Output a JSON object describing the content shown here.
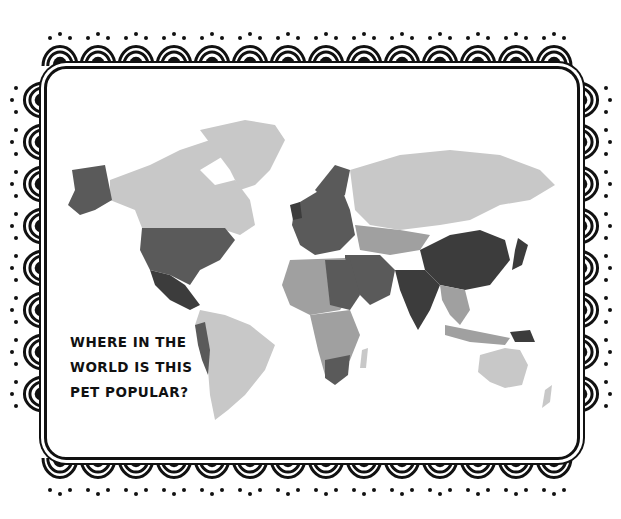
{
  "caption": {
    "lines": [
      "WHERE IN THE",
      "WORLD IS THIS",
      "PET POPULAR?"
    ]
  },
  "map": {
    "type": "grayscale world choropleth",
    "shades": {
      "light": "#c8c8c8",
      "mid": "#a0a0a0",
      "dark": "#5a5a5a",
      "darkest": "#3c3c3c"
    },
    "regions": [
      {
        "name": "Alaska",
        "shade": "dark"
      },
      {
        "name": "Canada",
        "shade": "light"
      },
      {
        "name": "Greenland",
        "shade": "light"
      },
      {
        "name": "United States",
        "shade": "dark"
      },
      {
        "name": "Mexico",
        "shade": "darkest"
      },
      {
        "name": "South America",
        "shade": "light"
      },
      {
        "name": "Europe",
        "shade": "dark"
      },
      {
        "name": "Russia",
        "shade": "light"
      },
      {
        "name": "Africa",
        "shade": "mid"
      },
      {
        "name": "Middle East",
        "shade": "dark"
      },
      {
        "name": "China",
        "shade": "darkest"
      },
      {
        "name": "India",
        "shade": "darkest"
      },
      {
        "name": "Southeast Asia",
        "shade": "mid"
      },
      {
        "name": "Australia",
        "shade": "light"
      },
      {
        "name": "New Zealand",
        "shade": "light"
      }
    ]
  },
  "frame": {
    "style": "scalloped doodle border",
    "color": "#111111"
  }
}
